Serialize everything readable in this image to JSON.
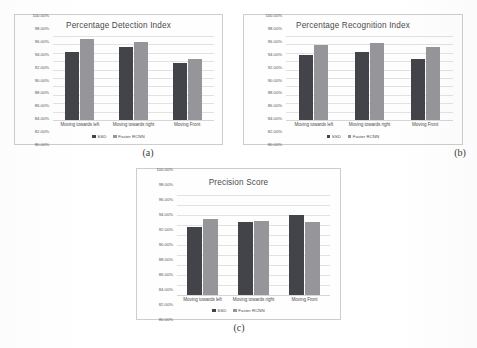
{
  "figure": {
    "background": "#ffffff",
    "series_colors": {
      "ssd": "#43434a",
      "faster_rcnn": "#95959a"
    }
  },
  "legend": {
    "ssd_label": "SSD",
    "rcnn_label": "Faster RCNN"
  },
  "captions": {
    "a": "(a)",
    "b": "(b)",
    "c": "(c)"
  },
  "chart_data": [
    {
      "id": "a",
      "type": "bar",
      "title": "Percentage Detection Index",
      "xlabel": "",
      "ylabel": "",
      "ylim": [
        80,
        100
      ],
      "grid": true,
      "legend_position": "bottom",
      "categories": [
        "Moving towards left",
        "Moving towards right",
        "Moving Front"
      ],
      "ytick_labels": [
        "100.00%",
        "98.00%",
        "96.00%",
        "94.00%",
        "92.00%",
        "90.00%",
        "88.00%",
        "86.00%",
        "84.00%",
        "82.00%",
        "80.00%"
      ],
      "yticks": [
        100,
        98,
        96,
        94,
        92,
        90,
        88,
        86,
        84,
        82,
        80
      ],
      "series": [
        {
          "name": "SSD",
          "values": [
            96.3,
            97.5,
            93.5
          ]
        },
        {
          "name": "Faster RCNN",
          "values": [
            99.3,
            98.6,
            94.6
          ]
        }
      ]
    },
    {
      "id": "b",
      "type": "bar",
      "title": "Percentage Recognition Index",
      "xlabel": "",
      "ylabel": "",
      "ylim": [
        80,
        100
      ],
      "grid": true,
      "legend_position": "bottom",
      "categories": [
        "Moving towards left",
        "Moving towards right",
        "Moving Front"
      ],
      "ytick_labels": [
        "100.00%",
        "98.00%",
        "96.00%",
        "94.00%",
        "92.00%",
        "90.00%",
        "88.00%",
        "86.00%",
        "84.00%",
        "82.00%",
        "80.00%"
      ],
      "yticks": [
        100,
        98,
        96,
        94,
        92,
        90,
        88,
        86,
        84,
        82,
        80
      ],
      "series": [
        {
          "name": "SSD",
          "values": [
            95.4,
            96.3,
            94.6
          ]
        },
        {
          "name": "Faster RCNN",
          "values": [
            97.9,
            98.4,
            97.4
          ]
        }
      ]
    },
    {
      "id": "c",
      "type": "bar",
      "title": "Precision Score",
      "xlabel": "",
      "ylabel": "",
      "ylim": [
        80,
        100
      ],
      "grid": true,
      "legend_position": "bottom",
      "categories": [
        "Moving towards left",
        "Moving towards right",
        "Moving Front"
      ],
      "ytick_labels": [
        "100.00%",
        "98.00%",
        "96.00%",
        "94.00%",
        "92.00%",
        "90.00%",
        "88.00%",
        "86.00%",
        "84.00%",
        "82.00%",
        "80.00%"
      ],
      "yticks": [
        100,
        98,
        96,
        94,
        92,
        90,
        88,
        86,
        84,
        82,
        80
      ],
      "series": [
        {
          "name": "SSD",
          "values": [
            93.7,
            94.7,
            96.0
          ]
        },
        {
          "name": "Faster RCNN",
          "values": [
            95.2,
            94.9,
            94.7
          ]
        }
      ]
    }
  ]
}
